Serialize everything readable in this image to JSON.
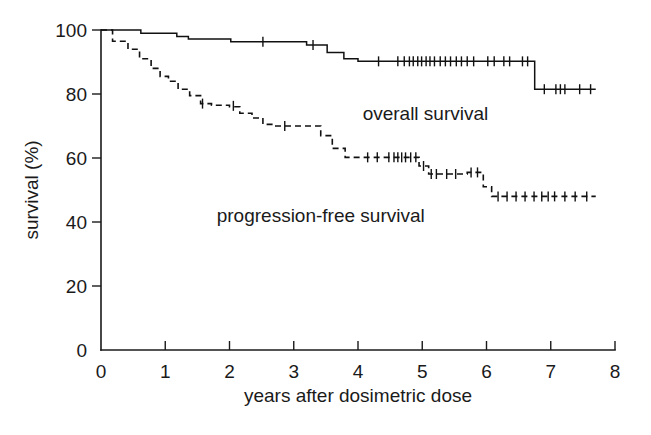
{
  "chart_data": {
    "type": "line",
    "title": "",
    "subtitle": "",
    "xlabel": "years after dosimetric dose",
    "ylabel": "survival  (%)",
    "xlim": [
      0,
      8
    ],
    "ylim": [
      0,
      100
    ],
    "xticks": [
      0,
      1,
      2,
      3,
      4,
      5,
      6,
      7,
      8
    ],
    "xtick_labels": [
      "0",
      "1",
      "2",
      "3",
      "4",
      "5",
      "6",
      "7",
      "8"
    ],
    "yticks": [
      0,
      20,
      40,
      60,
      80,
      100
    ],
    "ytick_labels": [
      "0",
      "20",
      "40",
      "60",
      "80",
      "100"
    ],
    "grid": false,
    "legend_position": "inline-annotations",
    "axis_style": "open-L-frame",
    "series": [
      {
        "name": "overall survival",
        "label": "overall survival",
        "style": "solid",
        "color": "#111111",
        "annotation_label": "overall survival",
        "annotation_x": 5.05,
        "annotation_y": 72,
        "steps": [
          [
            0.0,
            100
          ],
          [
            0.62,
            100
          ],
          [
            0.62,
            99.0
          ],
          [
            1.18,
            99.0
          ],
          [
            1.18,
            98.0
          ],
          [
            1.36,
            98.0
          ],
          [
            1.36,
            97.2
          ],
          [
            2.02,
            97.2
          ],
          [
            2.02,
            96.3
          ],
          [
            3.2,
            96.3
          ],
          [
            3.2,
            95.3
          ],
          [
            3.52,
            95.3
          ],
          [
            3.52,
            93.0
          ],
          [
            3.78,
            93.0
          ],
          [
            3.78,
            91.0
          ],
          [
            4.0,
            91.0
          ],
          [
            4.0,
            90.2
          ],
          [
            6.75,
            90.2
          ],
          [
            6.75,
            81.5
          ],
          [
            7.7,
            81.5
          ]
        ],
        "censor_marks": [
          [
            2.52,
            96.3
          ],
          [
            3.3,
            95.3
          ],
          [
            4.32,
            90.2
          ],
          [
            4.62,
            90.2
          ],
          [
            4.72,
            90.2
          ],
          [
            4.8,
            90.2
          ],
          [
            4.86,
            90.2
          ],
          [
            4.93,
            90.2
          ],
          [
            4.99,
            90.2
          ],
          [
            5.06,
            90.2
          ],
          [
            5.12,
            90.2
          ],
          [
            5.19,
            90.2
          ],
          [
            5.28,
            90.2
          ],
          [
            5.36,
            90.2
          ],
          [
            5.44,
            90.2
          ],
          [
            5.53,
            90.2
          ],
          [
            5.61,
            90.2
          ],
          [
            5.7,
            90.2
          ],
          [
            5.8,
            90.2
          ],
          [
            6.02,
            90.2
          ],
          [
            6.12,
            90.2
          ],
          [
            6.27,
            90.2
          ],
          [
            6.36,
            90.2
          ],
          [
            6.56,
            90.2
          ],
          [
            6.64,
            90.2
          ],
          [
            6.9,
            81.5
          ],
          [
            7.08,
            81.5
          ],
          [
            7.15,
            81.5
          ],
          [
            7.22,
            81.5
          ],
          [
            7.45,
            81.5
          ],
          [
            7.62,
            81.5
          ]
        ]
      },
      {
        "name": "progression-free survival",
        "label": "progression-free survival",
        "style": "dashed",
        "color": "#111111",
        "annotation_label": "progression-free survival",
        "annotation_x": 3.42,
        "annotation_y": 40,
        "steps": [
          [
            0.0,
            100
          ],
          [
            0.18,
            100
          ],
          [
            0.18,
            96.5
          ],
          [
            0.42,
            96.5
          ],
          [
            0.42,
            94.0
          ],
          [
            0.6,
            94.0
          ],
          [
            0.6,
            91.0
          ],
          [
            0.78,
            91.0
          ],
          [
            0.78,
            88.0
          ],
          [
            0.92,
            88.0
          ],
          [
            0.92,
            85.5
          ],
          [
            1.05,
            85.5
          ],
          [
            1.05,
            84.0
          ],
          [
            1.2,
            84.0
          ],
          [
            1.2,
            81.5
          ],
          [
            1.38,
            81.5
          ],
          [
            1.38,
            79.5
          ],
          [
            1.55,
            79.5
          ],
          [
            1.55,
            77.0
          ],
          [
            1.72,
            77.0
          ],
          [
            1.72,
            76.5
          ],
          [
            2.0,
            76.5
          ],
          [
            2.0,
            76.0
          ],
          [
            2.16,
            76.0
          ],
          [
            2.16,
            74.0
          ],
          [
            2.35,
            74.0
          ],
          [
            2.35,
            72.5
          ],
          [
            2.52,
            72.5
          ],
          [
            2.52,
            70.5
          ],
          [
            2.72,
            70.5
          ],
          [
            2.72,
            70.0
          ],
          [
            3.42,
            70.0
          ],
          [
            3.42,
            67.0
          ],
          [
            3.6,
            67.0
          ],
          [
            3.6,
            63.0
          ],
          [
            3.8,
            63.0
          ],
          [
            3.8,
            60.2
          ],
          [
            4.95,
            60.2
          ],
          [
            4.95,
            57.5
          ],
          [
            5.1,
            57.5
          ],
          [
            5.1,
            55.0
          ],
          [
            5.7,
            55.0
          ],
          [
            5.7,
            55.5
          ],
          [
            5.95,
            55.5
          ],
          [
            5.95,
            51.0
          ],
          [
            6.08,
            51.0
          ],
          [
            6.08,
            48.0
          ],
          [
            7.7,
            48.0
          ]
        ],
        "censor_marks": [
          [
            1.58,
            77.0
          ],
          [
            2.06,
            76.3
          ],
          [
            2.86,
            70.0
          ],
          [
            4.15,
            60.2
          ],
          [
            4.3,
            60.2
          ],
          [
            4.48,
            60.2
          ],
          [
            4.56,
            60.2
          ],
          [
            4.62,
            60.2
          ],
          [
            4.68,
            60.2
          ],
          [
            4.74,
            60.2
          ],
          [
            4.82,
            60.2
          ],
          [
            4.9,
            60.2
          ],
          [
            5.02,
            57.5
          ],
          [
            5.14,
            55.0
          ],
          [
            5.22,
            55.0
          ],
          [
            5.38,
            55.0
          ],
          [
            5.52,
            55.0
          ],
          [
            5.76,
            55.5
          ],
          [
            5.86,
            55.5
          ],
          [
            6.18,
            48.0
          ],
          [
            6.32,
            48.0
          ],
          [
            6.46,
            48.0
          ],
          [
            6.6,
            48.0
          ],
          [
            6.74,
            48.0
          ],
          [
            6.86,
            48.0
          ],
          [
            6.96,
            48.0
          ],
          [
            7.06,
            48.0
          ],
          [
            7.22,
            48.0
          ],
          [
            7.38,
            48.0
          ],
          [
            7.56,
            48.0
          ]
        ]
      }
    ]
  },
  "axes": {
    "x_axis_label": "years after dosimetric dose",
    "y_axis_label": "survival  (%)",
    "x_tick_labels": [
      "0",
      "1",
      "2",
      "3",
      "4",
      "5",
      "6",
      "7",
      "8"
    ],
    "y_tick_labels": [
      "0",
      "20",
      "40",
      "60",
      "80",
      "100"
    ]
  },
  "annotations": {
    "overall_survival": "overall survival",
    "progression_free_survival": "progression-free survival"
  }
}
